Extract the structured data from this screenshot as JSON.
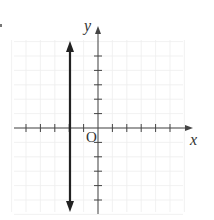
{
  "diagram": {
    "type": "coordinate-plane",
    "labels": {
      "x_axis": "x",
      "y_axis": "y",
      "origin": "O"
    },
    "x_ticks": [
      -5,
      -4,
      -3,
      -2,
      -1,
      1,
      2,
      3,
      4,
      5
    ],
    "y_ticks": [
      -5,
      -4,
      -3,
      -2,
      -1,
      1,
      2,
      3,
      4,
      5
    ],
    "grid": {
      "visible": true,
      "color": "#eeeeee"
    },
    "lines": [
      {
        "kind": "vertical",
        "x": -2,
        "style": "bold",
        "arrows": "both"
      }
    ],
    "colors": {
      "axis": "#333333",
      "bold_line": "#222222"
    }
  }
}
